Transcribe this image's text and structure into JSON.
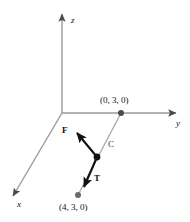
{
  "figure": {
    "background": "#ffffff",
    "axis_color": "#9a9a9a",
    "vector_color": "#111111",
    "segment_color": "#a8a8a8",
    "point_color": "#3c3c3c",
    "axes": [
      {
        "name": "z",
        "label": "z",
        "x": 71,
        "y": 16
      },
      {
        "name": "y",
        "label": "y",
        "x": 176,
        "y": 124
      },
      {
        "name": "x",
        "label": "x",
        "x": 17,
        "y": 206
      }
    ],
    "points": [
      {
        "name": "point-0-3-0",
        "label": "(0, 3, 0)",
        "x": 100,
        "y": 100,
        "px": 121,
        "py": 113
      },
      {
        "name": "point-4-3-0",
        "label": "(4, 3, 0)",
        "x": 60,
        "y": 209,
        "px": 78,
        "py": 195
      }
    ],
    "segment": {
      "name": "C",
      "label": "C",
      "x": 108,
      "y": 144,
      "from": "(0, 3, 0)",
      "to": "(4, 3, 0)"
    },
    "vectors": [
      {
        "name": "F",
        "label": "F",
        "x": 62,
        "y": 127,
        "tail_x": 97,
        "tail_y": 157,
        "tip_x": 77,
        "tip_y": 133
      },
      {
        "name": "T",
        "label": "T",
        "x": 94,
        "y": 176,
        "tail_x": 97,
        "tail_y": 157,
        "tip_x": 84,
        "tip_y": 187
      }
    ],
    "junction": {
      "name": "vector-junction",
      "x": 97,
      "y": 157
    }
  }
}
